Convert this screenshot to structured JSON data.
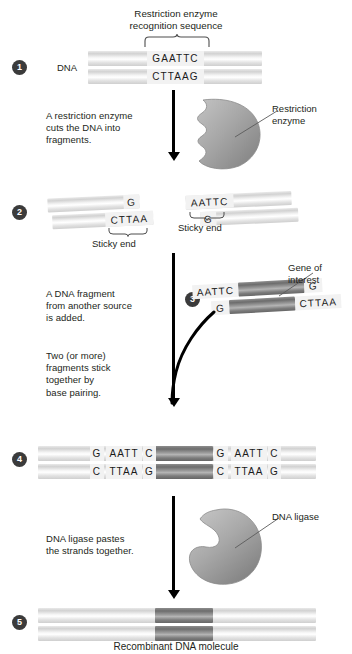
{
  "diagram": {
    "title_top": "Restriction enzyme\nrecognition sequence",
    "title_top_line1": "Restriction enzyme",
    "title_top_line2": "recognition sequence",
    "bottom_caption": "Recombinant DNA molecule"
  },
  "steps": [
    {
      "number": "1"
    },
    {
      "number": "2"
    },
    {
      "number": "3"
    },
    {
      "number": "4"
    },
    {
      "number": "5"
    }
  ],
  "step1": {
    "dna_label": "DNA",
    "top_sequence": "GAATTC",
    "bottom_sequence": "CTTAAG"
  },
  "step1_caption": {
    "line1": "A restriction enzyme",
    "line2": "cuts the DNA into",
    "line3": "fragments."
  },
  "enzyme_label": {
    "line1": "Restriction",
    "line2": "enzyme"
  },
  "step2": {
    "left_top_sequence": "G",
    "left_bottom_sequence": "CTTAA",
    "left_sticky_label": "Sticky end",
    "right_top_sequence": "AATTC",
    "right_bottom_sequence": "G",
    "right_sticky_label": "Sticky end"
  },
  "step3_caption": {
    "line1": "A DNA fragment",
    "line2": "from another source",
    "line3": "is added."
  },
  "step3": {
    "top_sequence_left": "AATTC",
    "top_sequence_right": "G",
    "bottom_sequence_left": "G",
    "bottom_sequence_right": "CTTAA",
    "gene_label_line1": "Gene of",
    "gene_label_line2": "interest"
  },
  "step4_caption": {
    "line1": "Two (or more)",
    "line2": "fragments stick",
    "line3": "together by",
    "line4": "base pairing."
  },
  "step4": {
    "top_seq_1": "G",
    "top_seq_2": "AATT",
    "top_seq_3": "C",
    "top_seq_4": "G",
    "top_seq_5": "AATT",
    "top_seq_6": "C",
    "bottom_seq_1": "C",
    "bottom_seq_2": "TTAA",
    "bottom_seq_3": "G",
    "bottom_seq_4": "C",
    "bottom_seq_5": "TTAA",
    "bottom_seq_6": "G"
  },
  "step5_caption": {
    "line1": "DNA ligase pastes",
    "line2": "the strands together."
  },
  "ligase_label": "DNA ligase",
  "colors": {
    "ink": "#231f20",
    "badge_bg": "#3b3b3b",
    "arrow": "#000000",
    "blob_light": "#b9b9b9",
    "blob_dark": "#7e7e7e",
    "gene_dark": "#6d6d6d",
    "strand_light": "#e2e2e2"
  }
}
